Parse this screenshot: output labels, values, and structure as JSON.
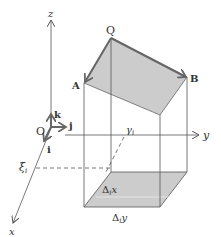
{
  "diagram": {
    "axes": {
      "z_label": "z",
      "y_label": "y",
      "x_label": "x",
      "origin_label": "O"
    },
    "unit_vectors": {
      "k": "k",
      "j": "j",
      "i": "i"
    },
    "points": {
      "Q": "Q",
      "A": "A",
      "B": "B"
    },
    "markers": {
      "xi": "ξ",
      "xi_sub": "i",
      "gamma": "γ",
      "gamma_sub": "i"
    },
    "increments": {
      "dx_delta": "Δ",
      "dx_sub": "i",
      "dx_var": "x",
      "dy_delta": "Δ",
      "dy_sub": "i",
      "dy_var": "y"
    },
    "colors": {
      "fill": "#cccccc",
      "stroke": "#555555",
      "arrow": "#666666"
    }
  }
}
